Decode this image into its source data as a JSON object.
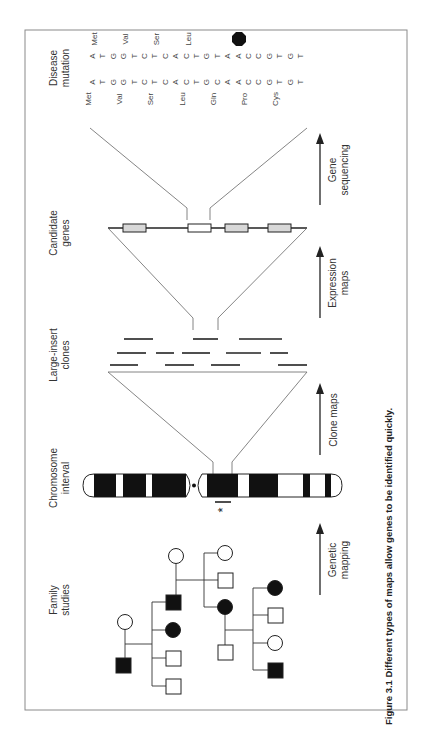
{
  "figure": {
    "caption": "Figure 3.1  Different types of maps allow genes to be identified quickly.",
    "frame_color": "#8a8a8a",
    "ink_color": "#222222",
    "gene_fill": "#d8d8d8"
  },
  "stages": [
    {
      "id": "disease",
      "label_line1": "Disease",
      "label_line2": "mutation"
    },
    {
      "id": "genes",
      "label_line1": "Candidate",
      "label_line2": "genes"
    },
    {
      "id": "clones",
      "label_line1": "Large-insert",
      "label_line2": "clones"
    },
    {
      "id": "chromosome",
      "label_line1": "Chromosome",
      "label_line2": "interval"
    },
    {
      "id": "family",
      "label_line1": "Family",
      "label_line2": "studies"
    }
  ],
  "arrows": [
    {
      "label_line1": "Gene",
      "label_line2": "sequencing"
    },
    {
      "label_line1": "Expression",
      "label_line2": "maps"
    },
    {
      "label_line1": "Clone maps",
      "label_line2": ""
    },
    {
      "label_line1": "Genetic",
      "label_line2": "mapping"
    }
  ],
  "sequence": {
    "normal_bases": [
      "A",
      "T",
      "G",
      "G",
      "T",
      "C",
      "T",
      "C",
      "A",
      "C",
      "T",
      "G",
      "C",
      "A",
      "A",
      "C",
      "C",
      "G",
      "T",
      "G",
      "T"
    ],
    "mutant_bases": [
      "A",
      "T",
      "G",
      "G",
      "T",
      "C",
      "T",
      "C",
      "A",
      "C",
      "T",
      "G",
      "T",
      "A",
      "A",
      "C",
      "C",
      "G",
      "T",
      "G",
      "T"
    ],
    "normal_codons": [
      "Met",
      "Val",
      "Ser",
      "Leu",
      "Gln",
      "Pro",
      "Cys"
    ],
    "mutant_codons": [
      "Met",
      "Val",
      "Ser",
      "Leu",
      "STOP"
    ],
    "stop_label": "STOP"
  },
  "chromosome": {
    "asterisk": "*"
  }
}
